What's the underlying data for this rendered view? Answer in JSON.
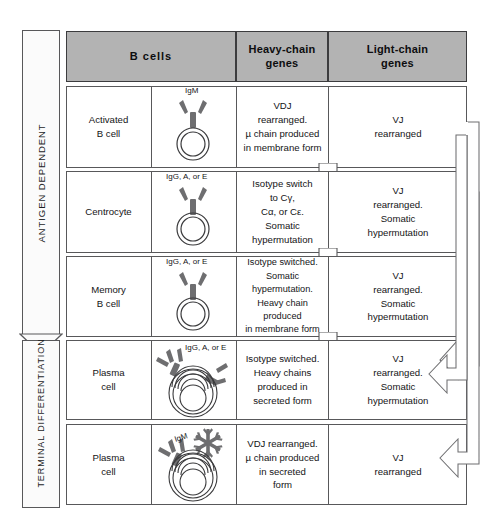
{
  "figure": {
    "header": {
      "b_cells": "B cells",
      "heavy_chain": "Heavy-chain\ngenes",
      "heavy_chain_line1": "Heavy-chain",
      "heavy_chain_line2": "genes",
      "light_chain_line1": "Light-chain",
      "light_chain_line2": "genes"
    },
    "stage_arrows": [
      {
        "label": "ANTIGEN  DEPENDENT",
        "name": "antigen-dependent-arrow"
      },
      {
        "label": "TERMINAL DIFFERENTIATION",
        "name": "terminal-differentiation-arrow"
      }
    ],
    "rows": [
      {
        "name": "activated-b-cell",
        "cell_name_line1": "Activated",
        "cell_name_line2": "B cell",
        "antibody_label": "IgM",
        "cell_type": "membrane-ig-cell",
        "heavy_chain": "VDJ\nrearranged.\nµ chain produced\nin membrane form",
        "light_chain": "VJ\nrearranged"
      },
      {
        "name": "centrocyte",
        "cell_name_line1": "Centrocyte",
        "cell_name_line2": "",
        "antibody_label": "IgG, A, or E",
        "cell_type": "membrane-ig-cell",
        "heavy_chain": "Isotype  switch\nto  Cγ,\nCα, or Cε.\nSomatic\nhypermutation",
        "light_chain": "VJ\nrearranged.\nSomatic\nhypermutation"
      },
      {
        "name": "memory-b-cell",
        "cell_name_line1": "Memory",
        "cell_name_line2": "B cell",
        "antibody_label": "IgG, A, or E",
        "cell_type": "membrane-ig-cell",
        "heavy_chain": "Isotype switched.\nSomatic\nhypermutation.\nHeavy chain produced\nin membrane form",
        "light_chain": "VJ\nrearranged.\nSomatic\nhypermutation"
      },
      {
        "name": "plasma-cell-switched",
        "cell_name_line1": "Plasma",
        "cell_name_line2": "cell",
        "antibody_label": "IgG, A, or E",
        "cell_type": "secreting-plasma-cell",
        "heavy_chain": "Isotype switched.\nHeavy chains\nproduced in\nsecreted form",
        "light_chain": "VJ\nrearranged.\nSomatic\nhypermutation"
      },
      {
        "name": "plasma-cell-igm",
        "cell_name_line1": "Plasma",
        "cell_name_line2": "cell",
        "antibody_label": "IgM",
        "cell_type": "secreting-plasma-cell-pentamer",
        "heavy_chain": "VDJ rearranged.\nµ chain produced\nin secreted\nform",
        "light_chain": "VJ\nrearranged"
      }
    ],
    "colors": {
      "header_fill": "#b3b3b3",
      "border": "#58585a",
      "header_border": "#3c3c3e",
      "text": "#141416",
      "antibody_fill": "#6e6e70",
      "page_background": "#ffffff"
    },
    "flow_arrows": {
      "down_between_rows_count": 4,
      "recycle_to_plasma_switched": "centrocyte-to-plasma-cell-switched",
      "recycle_to_plasma_igm": "activated-b-cell-to-plasma-cell-igm"
    }
  }
}
